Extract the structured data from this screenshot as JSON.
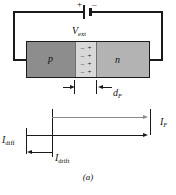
{
  "figure": {
    "caption": "(a)"
  },
  "circuit": {
    "battery": {
      "plus_sign": "+",
      "minus_sign": "–",
      "label_main": "V",
      "label_sub": "ext"
    }
  },
  "block": {
    "p_label": "p",
    "n_label": "n",
    "depletion": {
      "rows": [
        {
          "minus": "–",
          "plus": "+"
        },
        {
          "minus": "–",
          "plus": "+"
        },
        {
          "minus": "–",
          "plus": "+"
        },
        {
          "minus": "–",
          "plus": "+"
        }
      ]
    }
  },
  "dimensions": {
    "depletion_width_label": "",
    "df_main": "d",
    "df_sub": "F"
  },
  "currents": [
    {
      "id": "if",
      "main": "I",
      "sub": "F",
      "direction": "right",
      "color": "#8a8a8a"
    },
    {
      "id": "idiff",
      "main": "I",
      "sub": "diff",
      "direction": "right",
      "color": "#1a1a1a"
    },
    {
      "id": "idrift",
      "main": "I",
      "sub": "drift",
      "direction": "left",
      "color": "#1a1a1a"
    }
  ],
  "colors": {
    "p_region": "#8d8d8d",
    "n_region": "#b3b3b3",
    "depletion_region": "#d8d8d8",
    "wire": "#1a1a1a",
    "gray_arrow": "#8a8a8a"
  }
}
